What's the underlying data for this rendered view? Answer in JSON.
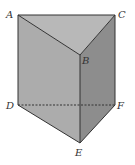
{
  "diagram": {
    "type": "triangular-prism",
    "colors": {
      "top_face": "#b8b8b8",
      "left_face": "#acacac",
      "right_face": "#8d8d8d",
      "bottom_face": "#a2a2a2",
      "edge": "#333333",
      "hidden_edge": "#333333",
      "background": "#ffffff"
    },
    "vertices": {
      "A": {
        "label": "A",
        "x": 18,
        "y": 15
      },
      "B": {
        "label": "B",
        "x": 80,
        "y": 55
      },
      "C": {
        "label": "C",
        "x": 115,
        "y": 15
      },
      "D": {
        "label": "D",
        "x": 18,
        "y": 105
      },
      "E": {
        "label": "E",
        "x": 80,
        "y": 143
      },
      "F": {
        "label": "F",
        "x": 115,
        "y": 105
      }
    },
    "visible_edges": [
      "AB",
      "BC",
      "CA",
      "AD",
      "BE",
      "CF",
      "DE",
      "EF"
    ],
    "hidden_edges": [
      "DF"
    ]
  }
}
